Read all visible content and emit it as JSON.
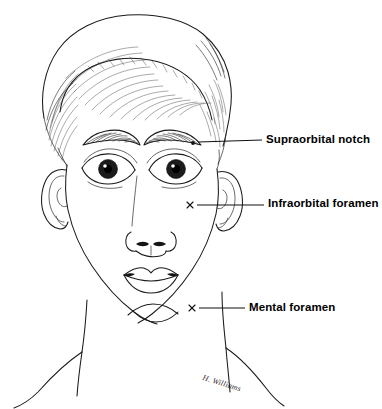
{
  "figure": {
    "background_color": "#ffffff",
    "ink_color": "#1a1a1a",
    "signature": "H. Williams"
  },
  "labels": [
    {
      "id": "supraorbital",
      "text": "Supraorbital notch",
      "marker": "dot",
      "marker_point": [
        193,
        143
      ],
      "leader_start": [
        198,
        143
      ],
      "leader_end": [
        262,
        140
      ]
    },
    {
      "id": "infraorbital",
      "text": "Infraorbital foramen",
      "marker": "x",
      "marker_point": [
        190,
        205
      ],
      "leader_start": [
        196,
        205
      ],
      "leader_end": [
        264,
        205
      ]
    },
    {
      "id": "mental",
      "text": "Mental foramen",
      "marker": "x",
      "marker_point": [
        192,
        308
      ],
      "leader_start": [
        197,
        308
      ],
      "leader_end": [
        245,
        308
      ]
    }
  ]
}
